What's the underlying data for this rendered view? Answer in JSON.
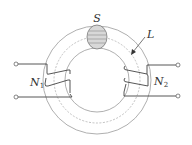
{
  "diagram": {
    "type": "toroidal transformer",
    "labels": {
      "cross_section": "S",
      "mean_path": "L",
      "primary": {
        "base": "N",
        "sub": "1"
      },
      "secondary": {
        "base": "N",
        "sub": "2"
      }
    },
    "colors": {
      "stroke": "#555555",
      "ring": "#9a9a9a",
      "section_fill": "#d8d8d8",
      "section_lines": "#8a8a8a",
      "text": "#333333"
    }
  }
}
